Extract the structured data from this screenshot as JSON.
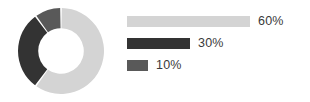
{
  "chart_data": {
    "type": "pie",
    "variant": "donut",
    "title": "",
    "xlabel": "",
    "ylabel": "",
    "categories": [
      "60%",
      "30%",
      "10%"
    ],
    "values": [
      60,
      30,
      10
    ],
    "labels": [
      "60%",
      "30%",
      "10%"
    ],
    "colors": [
      "#d4d4d4",
      "#333333",
      "#595959"
    ],
    "legend_position": "right",
    "legend_style": "proportional-bars",
    "grid": false,
    "start_angle_deg": 0,
    "direction": "clockwise",
    "inner_radius_ratio": 0.53,
    "slice_gap": true,
    "slice_gap_color": "#ffffff"
  },
  "legend": {
    "items": [
      {
        "label": "60%",
        "value": 60,
        "color": "#d4d4d4",
        "bar_width_px": 123
      },
      {
        "label": "30%",
        "value": 30,
        "color": "#333333",
        "bar_width_px": 63
      },
      {
        "label": "10%",
        "value": 10,
        "color": "#595959",
        "bar_width_px": 21
      }
    ]
  }
}
